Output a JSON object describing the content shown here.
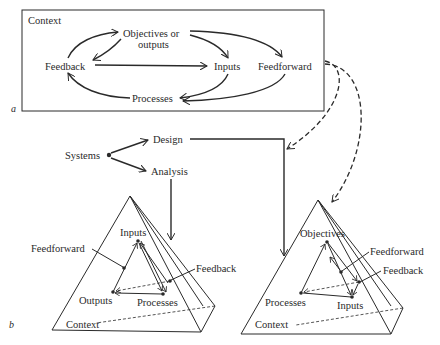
{
  "panel_a": {
    "panel_label": "a",
    "context": "Context",
    "objectives_line1": "Objectives or",
    "objectives_line2": "outputs",
    "feedback": "Feedback",
    "inputs": "Inputs",
    "feedforward": "Feedforward",
    "processes": "Processes"
  },
  "middle": {
    "systems": "Systems",
    "design": "Design",
    "analysis": "Analysis"
  },
  "panel_b": {
    "panel_label": "b",
    "left_pyramid": {
      "inputs": "Inputs",
      "feedforward": "Feedforward",
      "feedback": "Feedback",
      "outputs": "Outputs",
      "processes": "Processes",
      "context": "Context"
    },
    "right_pyramid": {
      "objectives": "Objectives",
      "feedforward": "Feedforward",
      "feedback": "Feedback",
      "processes": "Processes",
      "inputs": "Inputs",
      "context": "Context"
    }
  }
}
